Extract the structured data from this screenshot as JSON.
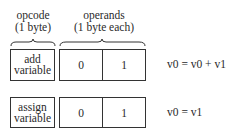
{
  "headers": {
    "opcode": {
      "line1": "opcode",
      "line2": "(1 byte)"
    },
    "operands": {
      "line1": "operands",
      "line2": "(1 byte each)"
    }
  },
  "rows": [
    {
      "opcode_line1": "add",
      "opcode_line2": "variable",
      "operand0": "0",
      "operand1": "1",
      "equation": "v0 = v0 + v1"
    },
    {
      "opcode_line1": "assign",
      "opcode_line2": "variable",
      "operand0": "0",
      "operand1": "1",
      "equation": "v0 = v1"
    }
  ]
}
